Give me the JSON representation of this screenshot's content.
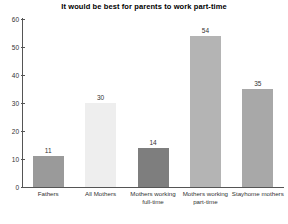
{
  "chart_data": {
    "type": "bar",
    "title": "It would be best for parents to work part-time",
    "xlabel": "",
    "ylabel": "",
    "categories": [
      "Fathers",
      "All Mothers",
      "Mothers working full-time",
      "Mothers working part-time",
      "Stayhome mothers"
    ],
    "values": [
      11,
      30,
      14,
      54,
      35
    ],
    "value_labels": [
      "11",
      "30",
      "14",
      "54",
      "35"
    ],
    "bar_colors": [
      "#9a9a9a",
      "#eeeeee",
      "#7e7e7e",
      "#b4b4b4",
      "#a8a8a8"
    ],
    "ylim": [
      0,
      60
    ],
    "yticks": [
      0,
      10,
      20,
      30,
      40,
      50,
      60
    ],
    "ytick_labels": [
      "0",
      "10",
      "20",
      "30",
      "40",
      "50",
      "60"
    ],
    "grid": false,
    "legend": "none",
    "axis_color": "#555555"
  }
}
